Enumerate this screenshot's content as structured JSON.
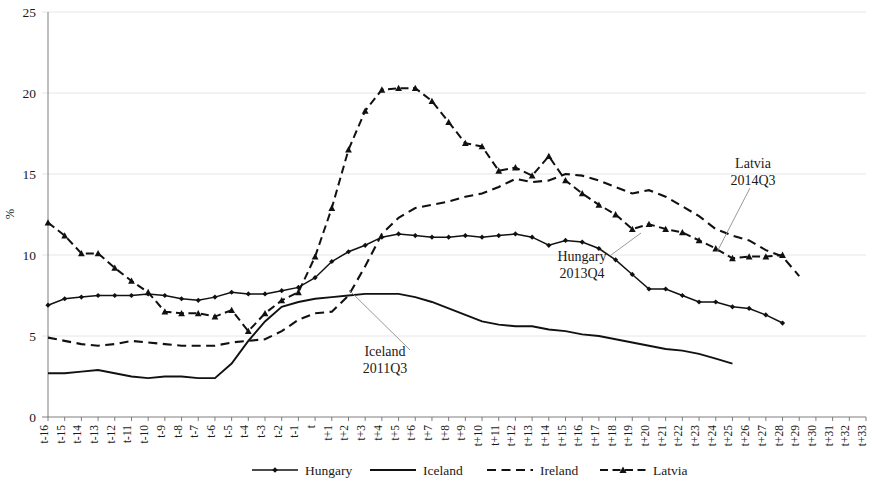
{
  "chart_data": {
    "type": "line",
    "title": "",
    "xlabel": "",
    "ylabel": "%",
    "ylim": [
      0,
      25
    ],
    "yticks": [
      0,
      5,
      10,
      15,
      20,
      25
    ],
    "grid": true,
    "legend_position": "bottom",
    "x": [
      "t-16",
      "t-15",
      "t-14",
      "t-13",
      "t-12",
      "t-11",
      "t-10",
      "t-9",
      "t-8",
      "t-7",
      "t-6",
      "t-5",
      "t-4",
      "t-3",
      "t-2",
      "t-1",
      "t",
      "t+1",
      "t+2",
      "t+3",
      "t+4",
      "t+5",
      "t+6",
      "t+7",
      "t+8",
      "t+9",
      "t+10",
      "t+11",
      "t+12",
      "t+13",
      "t+14",
      "t+15",
      "t+16",
      "t+17",
      "t+18",
      "t+19",
      "t+20",
      "t+21",
      "t+22",
      "t+23",
      "t+24",
      "t+25",
      "t+26",
      "t+27",
      "t+28",
      "t+29",
      "t+30",
      "t+31",
      "t+32",
      "t+33"
    ],
    "series": [
      {
        "name": "Hungary",
        "style": "solid-marker",
        "marker": "diamond",
        "values": [
          6.9,
          7.3,
          7.4,
          7.5,
          7.5,
          7.5,
          7.6,
          7.5,
          7.3,
          7.2,
          7.4,
          7.7,
          7.6,
          7.6,
          7.8,
          8.0,
          8.6,
          9.6,
          10.2,
          10.6,
          11.1,
          11.3,
          11.2,
          11.1,
          11.1,
          11.2,
          11.1,
          11.2,
          11.3,
          11.1,
          10.6,
          10.9,
          10.8,
          10.4,
          9.7,
          8.8,
          7.9,
          7.9,
          7.5,
          7.1,
          7.1,
          6.8,
          6.7,
          6.3,
          5.8,
          null,
          null,
          null,
          null,
          null
        ]
      },
      {
        "name": "Iceland",
        "style": "solid",
        "marker": "none",
        "values": [
          2.7,
          2.7,
          2.8,
          2.9,
          2.7,
          2.5,
          2.4,
          2.5,
          2.5,
          2.4,
          2.4,
          3.3,
          4.7,
          5.9,
          6.8,
          7.1,
          7.3,
          7.4,
          7.5,
          7.6,
          7.6,
          7.6,
          7.4,
          7.1,
          6.7,
          6.3,
          5.9,
          5.7,
          5.6,
          5.6,
          5.4,
          5.3,
          5.1,
          5.0,
          4.8,
          4.6,
          4.4,
          4.2,
          4.1,
          3.9,
          3.6,
          3.3,
          null,
          null,
          null,
          null,
          null,
          null,
          null,
          null
        ]
      },
      {
        "name": "Ireland",
        "style": "dashed",
        "marker": "none",
        "values": [
          4.9,
          4.7,
          4.5,
          4.4,
          4.5,
          4.7,
          4.6,
          4.5,
          4.4,
          4.4,
          4.4,
          4.6,
          4.7,
          4.8,
          5.3,
          6.0,
          6.4,
          6.5,
          7.5,
          9.3,
          11.3,
          12.3,
          12.9,
          13.1,
          13.3,
          13.6,
          13.8,
          14.2,
          14.7,
          14.5,
          14.6,
          15.0,
          14.9,
          14.6,
          14.2,
          13.8,
          14.0,
          13.6,
          13.0,
          12.4,
          11.6,
          11.2,
          10.9,
          10.3,
          9.9,
          8.7,
          null,
          null,
          null,
          null
        ]
      },
      {
        "name": "Latvia",
        "style": "dashed-marker",
        "marker": "triangle",
        "values": [
          12.0,
          11.2,
          10.1,
          10.1,
          9.2,
          8.4,
          7.7,
          6.5,
          6.4,
          6.4,
          6.2,
          6.6,
          5.3,
          6.4,
          7.2,
          7.7,
          9.9,
          12.9,
          16.5,
          18.9,
          20.2,
          20.3,
          20.3,
          19.5,
          18.2,
          16.9,
          16.7,
          15.2,
          15.4,
          14.9,
          16.1,
          14.6,
          13.8,
          13.1,
          12.5,
          11.6,
          11.9,
          11.6,
          11.4,
          10.9,
          10.4,
          9.8,
          9.9,
          9.9,
          10.0,
          null,
          null,
          null,
          null,
          null
        ]
      }
    ],
    "annotations": [
      {
        "name": "iceland-annotation",
        "line1": "Iceland",
        "line2": "2011Q3"
      },
      {
        "name": "hungary-annotation",
        "line1": "Hungary",
        "line2": "2013Q4"
      },
      {
        "name": "latvia-annotation",
        "line1": "Latvia",
        "line2": "2014Q3"
      }
    ],
    "legend": [
      {
        "name": "Hungary",
        "style": "solid-marker"
      },
      {
        "name": "Iceland",
        "style": "solid"
      },
      {
        "name": "Ireland",
        "style": "dashed"
      },
      {
        "name": "Latvia",
        "style": "dashed-marker"
      }
    ]
  }
}
